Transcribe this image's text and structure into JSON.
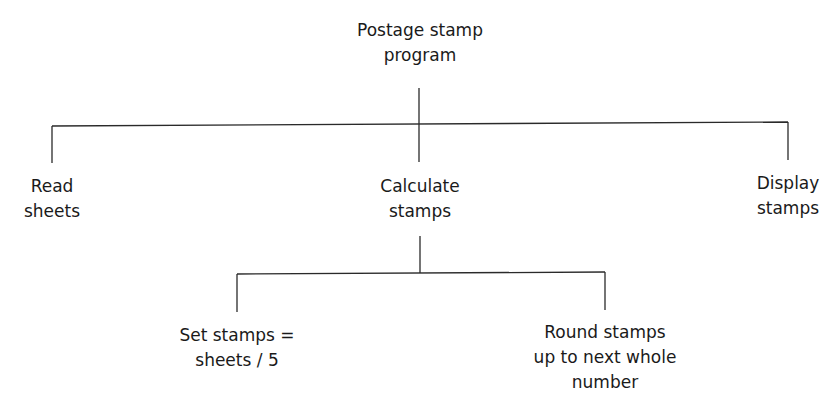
{
  "diagram": {
    "type": "structure-chart",
    "root": {
      "lines": [
        "Postage stamp",
        "program"
      ]
    },
    "level1": [
      {
        "lines": [
          "Read",
          "sheets"
        ]
      },
      {
        "lines": [
          "Calculate",
          "stamps"
        ]
      },
      {
        "lines": [
          "Display",
          "stamps"
        ]
      }
    ],
    "level2": [
      {
        "lines": [
          "Set stamps =",
          "sheets / 5"
        ]
      },
      {
        "lines": [
          "Round stamps",
          "up to next whole",
          "number"
        ]
      }
    ],
    "colors": {
      "line": "#2a2a2a",
      "text": "#1a1a1a",
      "background": "#ffffff"
    }
  }
}
